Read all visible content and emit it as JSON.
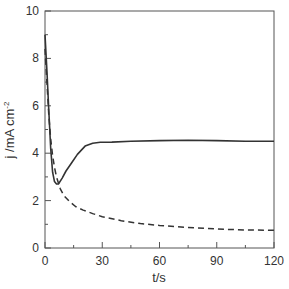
{
  "chart_data": {
    "type": "line",
    "title": "",
    "xlabel": "t/s",
    "ylabel": "j /mA cm",
    "ylabel_superscript": "-2",
    "xlim": [
      0,
      120
    ],
    "ylim": [
      0,
      10
    ],
    "xticks": [
      0,
      30,
      60,
      90,
      120
    ],
    "xticks_minor": [
      15,
      45,
      75,
      105
    ],
    "yticks": [
      0,
      2,
      4,
      6,
      8,
      10
    ],
    "yticks_minor": [
      1,
      3,
      5,
      7,
      9
    ],
    "grid": false,
    "legend": null,
    "series": [
      {
        "name": "solid",
        "style": "solid",
        "color": "#333333",
        "x": [
          0,
          1,
          2,
          3,
          4,
          5,
          6,
          7,
          9,
          11,
          14,
          17,
          21,
          25,
          29,
          35,
          45,
          60,
          75,
          90,
          105,
          120
        ],
        "y": [
          9.0,
          7.5,
          5.8,
          4.2,
          3.2,
          2.8,
          2.7,
          2.7,
          2.95,
          3.25,
          3.6,
          3.95,
          4.3,
          4.42,
          4.46,
          4.47,
          4.5,
          4.53,
          4.55,
          4.53,
          4.5,
          4.5
        ]
      },
      {
        "name": "dashed",
        "style": "dashed",
        "color": "#333333",
        "x": [
          0,
          1,
          2,
          3,
          4,
          5,
          6,
          8,
          10,
          13,
          16,
          20,
          25,
          30,
          40,
          50,
          60,
          75,
          90,
          105,
          120
        ],
        "y": [
          8.4,
          7.0,
          5.6,
          4.6,
          3.9,
          3.4,
          3.0,
          2.5,
          2.2,
          1.95,
          1.75,
          1.6,
          1.45,
          1.32,
          1.15,
          1.03,
          0.95,
          0.87,
          0.8,
          0.76,
          0.75
        ]
      }
    ]
  },
  "layout": {
    "plot_left": 45,
    "plot_top": 11,
    "plot_right": 274,
    "plot_bottom": 248
  }
}
